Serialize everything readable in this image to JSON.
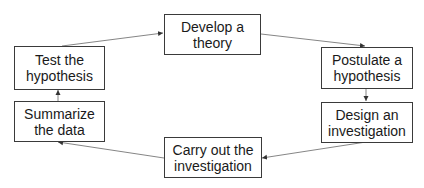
{
  "diagram": {
    "colors": {
      "border": "#3a3a3a",
      "text": "#1a1a1a",
      "arrow": "#555555",
      "background": "#ffffff"
    },
    "nodes": [
      {
        "id": "develop",
        "label": "Develop a theory",
        "lines": [
          "Develop a",
          "theory"
        ]
      },
      {
        "id": "postulate",
        "label": "Postulate a hypothesis",
        "lines": [
          "Postulate a",
          "hypothesis"
        ]
      },
      {
        "id": "design",
        "label": "Design an investigation",
        "lines": [
          "Design an",
          "investigation"
        ]
      },
      {
        "id": "carry",
        "label": "Carry out the investigation",
        "lines": [
          "Carry out the",
          "investigation"
        ]
      },
      {
        "id": "summarize",
        "label": "Summarize the data",
        "lines": [
          "Summarize",
          "the data"
        ]
      },
      {
        "id": "test",
        "label": "Test the hypothesis",
        "lines": [
          "Test the",
          "hypothesis"
        ]
      }
    ],
    "edges": [
      {
        "from": "develop",
        "to": "postulate"
      },
      {
        "from": "postulate",
        "to": "design"
      },
      {
        "from": "design",
        "to": "carry"
      },
      {
        "from": "carry",
        "to": "summarize"
      },
      {
        "from": "summarize",
        "to": "test"
      },
      {
        "from": "test",
        "to": "develop"
      }
    ]
  }
}
